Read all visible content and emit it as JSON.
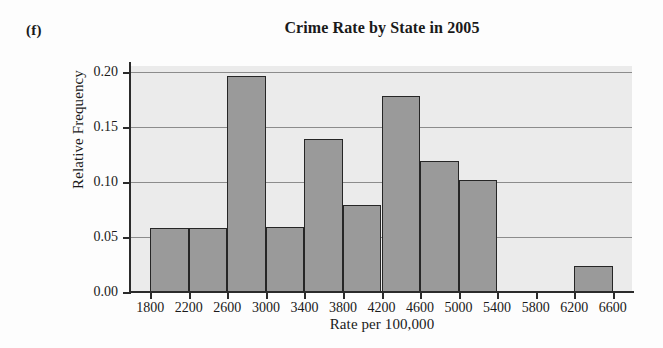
{
  "figure": {
    "part_label": "(f)"
  },
  "chart_data": {
    "type": "bar",
    "title": "Crime Rate by State in 2005",
    "xlabel": "Rate per 100,000",
    "ylabel": "Relative Frequency",
    "xlim": [
      1600,
      6800
    ],
    "ylim": [
      0.0,
      0.205
    ],
    "grid": true,
    "legend": null,
    "bin_width": 400,
    "xticks": [
      1800,
      2200,
      2600,
      3000,
      3400,
      3800,
      4200,
      4600,
      5000,
      5400,
      5800,
      6200,
      6600
    ],
    "xtick_labels": [
      "1800",
      "2200",
      "2600",
      "3000",
      "3400",
      "3800",
      "4200",
      "4600",
      "5000",
      "5400",
      "5800",
      "6200",
      "6600"
    ],
    "yticks": [
      0.0,
      0.05,
      0.1,
      0.15,
      0.2
    ],
    "ytick_labels": [
      "0.00",
      "0.05",
      "0.10",
      "0.15",
      "0.20"
    ],
    "bins": [
      {
        "left": 1800,
        "right": 2200,
        "value": 0.058,
        "label": "1800-2200"
      },
      {
        "left": 2200,
        "right": 2600,
        "value": 0.058,
        "label": "2200-2600"
      },
      {
        "left": 2600,
        "right": 3000,
        "value": 0.196,
        "label": "2600-3000"
      },
      {
        "left": 3000,
        "right": 3400,
        "value": 0.059,
        "label": "3000-3400"
      },
      {
        "left": 3400,
        "right": 3800,
        "value": 0.139,
        "label": "3400-3800"
      },
      {
        "left": 3800,
        "right": 4200,
        "value": 0.079,
        "label": "3800-4200"
      },
      {
        "left": 4200,
        "right": 4600,
        "value": 0.178,
        "label": "4200-4600"
      },
      {
        "left": 4600,
        "right": 5000,
        "value": 0.119,
        "label": "4600-5000"
      },
      {
        "left": 5000,
        "right": 5400,
        "value": 0.102,
        "label": "5000-5400"
      },
      {
        "left": 6200,
        "right": 6600,
        "value": 0.024,
        "label": "6200-6600"
      }
    ],
    "colors": {
      "bar_fill": "#9a9a9a",
      "bar_edge": "#262626",
      "plot_background": "#ebebeb",
      "gridline": "#8c8c8c",
      "axis": "#2b2b2b",
      "text": "#1a1a1a"
    }
  }
}
